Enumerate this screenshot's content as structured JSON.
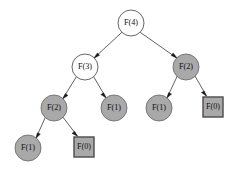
{
  "figure": {
    "background_color": "#ffffff",
    "width": 241,
    "height": 179,
    "colors": {
      "open_node_fill": "#ffffff",
      "shaded_node_fill": "#a9a9a9",
      "node_stroke": "#555555",
      "square_stroke": "#4a4a4a",
      "edge_stroke": "#3a3a3a",
      "label_color": "#111111"
    }
  },
  "tree": {
    "nodes": [
      {
        "id": "n0",
        "label": "F(4)",
        "function_name": "F",
        "argument": "4",
        "shape": "circle",
        "style": "open",
        "level": 0,
        "cx": 131,
        "cy": 23,
        "r": 13
      },
      {
        "id": "n1",
        "label": "F(3)",
        "function_name": "F",
        "argument": "3",
        "shape": "circle",
        "style": "open",
        "level": 1,
        "cx": 85,
        "cy": 67,
        "r": 13
      },
      {
        "id": "n2",
        "label": "F(2)",
        "function_name": "F",
        "argument": "2",
        "shape": "circle",
        "style": "shaded",
        "level": 1,
        "cx": 186,
        "cy": 67,
        "r": 13
      },
      {
        "id": "n3",
        "label": "F(2)",
        "function_name": "F",
        "argument": "2",
        "shape": "circle",
        "style": "shaded",
        "level": 2,
        "cx": 54,
        "cy": 108,
        "r": 13
      },
      {
        "id": "n4",
        "label": "F(1)",
        "function_name": "F",
        "argument": "1",
        "shape": "circle",
        "style": "shaded",
        "level": 2,
        "cx": 114,
        "cy": 108,
        "r": 13
      },
      {
        "id": "n5",
        "label": "F(1)",
        "function_name": "F",
        "argument": "1",
        "shape": "circle",
        "style": "shaded",
        "level": 2,
        "cx": 159,
        "cy": 108,
        "r": 13
      },
      {
        "id": "n6",
        "label": "F(0)",
        "function_name": "F",
        "argument": "0",
        "shape": "square",
        "style": "shaded",
        "level": 2,
        "cx": 213,
        "cy": 107,
        "size": 20
      },
      {
        "id": "n7",
        "label": "F(1)",
        "function_name": "F",
        "argument": "1",
        "shape": "circle",
        "style": "shaded",
        "level": 3,
        "cx": 28,
        "cy": 148,
        "r": 13
      },
      {
        "id": "n8",
        "label": "F(0)",
        "function_name": "F",
        "argument": "0",
        "shape": "square",
        "style": "shaded",
        "level": 3,
        "cx": 84,
        "cy": 147,
        "size": 20
      }
    ],
    "edges": [
      {
        "from": "n0",
        "to": "n1",
        "directed": true
      },
      {
        "from": "n0",
        "to": "n2",
        "directed": true
      },
      {
        "from": "n1",
        "to": "n3",
        "directed": true
      },
      {
        "from": "n1",
        "to": "n4",
        "directed": true
      },
      {
        "from": "n2",
        "to": "n5",
        "directed": true
      },
      {
        "from": "n2",
        "to": "n6",
        "directed": true
      },
      {
        "from": "n3",
        "to": "n7",
        "directed": true
      },
      {
        "from": "n3",
        "to": "n8",
        "directed": true
      }
    ]
  }
}
